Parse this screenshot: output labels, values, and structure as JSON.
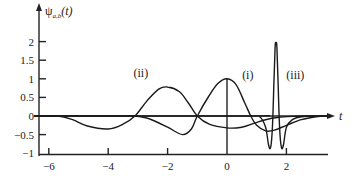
{
  "chart_data": {
    "type": "line",
    "title": "",
    "ylabel": "ψa,b(t)",
    "ylabel_main": "ψ",
    "ylabel_sub": "a,b",
    "ylabel_tail": "(t)",
    "xlabel": "t",
    "xlim": [
      -6.5,
      3.6
    ],
    "ylim": [
      -1,
      2.4
    ],
    "grid": false,
    "legend": "none (inline annotations)",
    "x_ticks": [
      -6,
      -4,
      -2,
      0,
      2
    ],
    "x_tick_labels": [
      "−6",
      "−4",
      "−2",
      "0",
      "2"
    ],
    "y_ticks": [
      2,
      1.5,
      1,
      0.5,
      0,
      -0.5,
      -1
    ],
    "y_tick_labels": [
      "2",
      "1.5",
      "1",
      "0.5",
      "0",
      "−0.5",
      "−1"
    ],
    "series": [
      {
        "name": "(i)",
        "description": "wavelet a=1, b=0",
        "x": [
          -6.5,
          -5.6,
          -5,
          -4.5,
          -4,
          -3.5,
          -3.1,
          -2.6,
          -2,
          -1.5,
          -1.2,
          -1,
          -0.6,
          -0.3,
          0,
          0.3,
          0.6,
          0.8,
          1.0,
          1.3,
          1.6,
          2.0,
          2.5,
          3.0,
          3.4
        ],
        "values": [
          0,
          0,
          0,
          0,
          0,
          0,
          0,
          -0.08,
          -0.3,
          -0.5,
          -0.35,
          0,
          0.55,
          0.88,
          1.0,
          0.85,
          0.35,
          0,
          -0.25,
          -0.4,
          -0.38,
          -0.25,
          -0.1,
          -0.02,
          0
        ]
      },
      {
        "name": "(ii)",
        "description": "wavelet dilated a=2, b=-2",
        "x": [
          -6.5,
          -5.7,
          -5.2,
          -4.7,
          -4.0,
          -3.5,
          -3.1,
          -2.7,
          -2.3,
          -2.0,
          -1.6,
          -1.3,
          -1.0,
          -0.6,
          0,
          0.5,
          0.9,
          1.3,
          1.7,
          2.2,
          2.7,
          3.2
        ],
        "values": [
          0,
          0,
          -0.1,
          -0.27,
          -0.35,
          -0.22,
          0,
          0.4,
          0.72,
          0.78,
          0.65,
          0.35,
          0,
          -0.22,
          -0.32,
          -0.3,
          -0.2,
          -0.1,
          -0.04,
          -0.01,
          0,
          0
        ]
      },
      {
        "name": "(iii)",
        "description": "wavelet compressed a=0.25, b=1.65",
        "x": [
          -6.5,
          0.8,
          1.1,
          1.3,
          1.4,
          1.47,
          1.53,
          1.58,
          1.62,
          1.65,
          1.68,
          1.72,
          1.77,
          1.83,
          1.9,
          2.0,
          2.2,
          2.5,
          3.4
        ],
        "values": [
          0,
          0,
          -0.02,
          -0.3,
          -0.78,
          -0.84,
          -0.3,
          0.9,
          1.85,
          1.97,
          1.85,
          0.9,
          -0.3,
          -0.84,
          -0.78,
          -0.3,
          -0.1,
          -0.02,
          0
        ]
      }
    ],
    "annotations": [
      {
        "text": "(i)",
        "x": 0.7,
        "y": 1.0
      },
      {
        "text": "(ii)",
        "x": -2.9,
        "y": 1.05
      },
      {
        "text": "(iii)",
        "x": 2.3,
        "y": 1.0
      }
    ]
  }
}
